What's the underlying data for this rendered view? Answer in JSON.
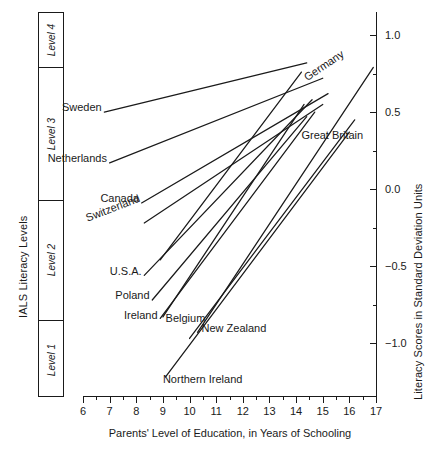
{
  "chart_data": {
    "type": "line",
    "title": "",
    "xlabel": "Parents' Level of Education, in Years of Schooling",
    "ylabel": "Literacy Scores in Standard Deviation Units",
    "ylabel_left": "IALS Literacy Levels",
    "xlim": [
      6,
      17
    ],
    "ylim": [
      -1.35,
      1.15
    ],
    "grid": false,
    "legend": "inline-labels",
    "xticks": [
      6,
      7,
      8,
      9,
      10,
      11,
      12,
      13,
      14,
      15,
      16,
      17
    ],
    "xtick_labels": [
      "6",
      "7",
      "8",
      "9",
      "10",
      "11",
      "12",
      "13",
      "14",
      "15",
      "16",
      "17"
    ],
    "xminor_step": 0.5,
    "yticks": [
      1.0,
      0.5,
      0.0,
      -0.5,
      -1.0
    ],
    "ytick_labels": [
      "1.0",
      "0.5",
      "0.0",
      "−0.5",
      "−1.0"
    ],
    "yminor": [
      0.75,
      0.25,
      -0.25,
      -0.75
    ],
    "level_bands": [
      {
        "name": "Level 4",
        "y_top": 1.15,
        "y_bottom": 0.79
      },
      {
        "name": "Level 3",
        "y_top": 0.79,
        "y_bottom": -0.07
      },
      {
        "name": "Level 2",
        "y_top": -0.07,
        "y_bottom": -0.85
      },
      {
        "name": "Level 1",
        "y_top": -0.85,
        "y_bottom": -1.35
      }
    ],
    "series": [
      {
        "name": "Sweden",
        "x": [
          6.8,
          14.4
        ],
        "y": [
          0.5,
          0.82
        ]
      },
      {
        "name": "Netherlands",
        "x": [
          7.0,
          15.0
        ],
        "y": [
          0.17,
          0.72
        ]
      },
      {
        "name": "Germany",
        "x": [
          8.9,
          14.2
        ],
        "y": [
          -0.46,
          0.76
        ]
      },
      {
        "name": "Canada",
        "x": [
          8.2,
          15.2
        ],
        "y": [
          -0.09,
          0.62
        ]
      },
      {
        "name": "Switzerland",
        "x": [
          8.3,
          15.0
        ],
        "y": [
          -0.22,
          0.55
        ]
      },
      {
        "name": "U.S.A.",
        "x": [
          8.3,
          14.6
        ],
        "y": [
          -0.56,
          0.58
        ]
      },
      {
        "name": "Poland",
        "x": [
          8.6,
          14.4
        ],
        "y": [
          -0.72,
          0.47
        ]
      },
      {
        "name": "Belgium",
        "x": [
          9.0,
          14.3
        ],
        "y": [
          -0.83,
          0.55
        ]
      },
      {
        "name": "Ireland",
        "x": [
          8.9,
          14.7
        ],
        "y": [
          -0.84,
          0.5
        ]
      },
      {
        "name": "New Zealand",
        "x": [
          10.3,
          16.9
        ],
        "y": [
          -0.93,
          0.79
        ]
      },
      {
        "name": "Great Britain",
        "x": [
          10.0,
          16.2
        ],
        "y": [
          -0.97,
          0.45
        ]
      },
      {
        "name": "Northern Ireland",
        "x": [
          9.1,
          16.0
        ],
        "y": [
          -1.22,
          0.37
        ]
      }
    ],
    "annotations": [
      {
        "text": "Sweden",
        "x": 6.7,
        "y": 0.53,
        "rotate": 0,
        "anchor": "end"
      },
      {
        "text": "Netherlands",
        "x": 6.9,
        "y": 0.2,
        "rotate": 0,
        "anchor": "end"
      },
      {
        "text": "Canada",
        "x": 8.1,
        "y": -0.06,
        "rotate": 0,
        "anchor": "end"
      },
      {
        "text": "Switzerland",
        "x": 8.25,
        "y": -0.19,
        "rotate": -21,
        "anchor": "end"
      },
      {
        "text": "U.S.A.",
        "x": 8.2,
        "y": -0.53,
        "rotate": 0,
        "anchor": "end"
      },
      {
        "text": "Poland",
        "x": 8.5,
        "y": -0.69,
        "rotate": 0,
        "anchor": "end"
      },
      {
        "text": "Ireland",
        "x": 8.8,
        "y": -0.82,
        "rotate": 0,
        "anchor": "end"
      },
      {
        "text": "Belgium",
        "x": 9.1,
        "y": -0.84,
        "rotate": 0,
        "anchor": "start"
      },
      {
        "text": "New Zealand",
        "x": 10.45,
        "y": -0.9,
        "rotate": 0,
        "anchor": "start"
      },
      {
        "text": "Northern Ireland",
        "x": 9.0,
        "y": -1.23,
        "rotate": 0,
        "anchor": "start"
      },
      {
        "text": "Germany",
        "x": 14.35,
        "y": 0.72,
        "rotate": -34,
        "anchor": "start"
      },
      {
        "text": "Great Britain",
        "x": 14.2,
        "y": 0.35,
        "rotate": 0,
        "anchor": "start"
      }
    ]
  }
}
